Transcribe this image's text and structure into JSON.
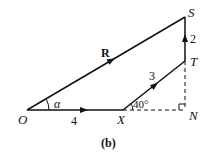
{
  "diagram": {
    "caption": "(b)",
    "points": {
      "O": {
        "label": "O",
        "x": 27,
        "y": 110
      },
      "X": {
        "label": "X",
        "x": 123,
        "y": 110
      },
      "N": {
        "label": "N",
        "x": 185,
        "y": 110
      },
      "T": {
        "label": "T",
        "x": 185,
        "y": 61
      },
      "S": {
        "label": "S",
        "x": 185,
        "y": 17
      }
    },
    "vectors": {
      "OX": {
        "label": "4"
      },
      "XT": {
        "label": "3"
      },
      "TS": {
        "label": "2"
      },
      "OS": {
        "label": "R"
      }
    },
    "angles": {
      "alpha": {
        "label": "α"
      },
      "xt_angle": {
        "label": "40°"
      }
    },
    "line_color": "#111111"
  }
}
